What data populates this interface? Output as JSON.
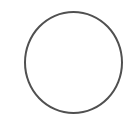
{
  "circle": {
    "label": "",
    "stroke_color": "#505050",
    "fill_color": "#ffffff"
  }
}
